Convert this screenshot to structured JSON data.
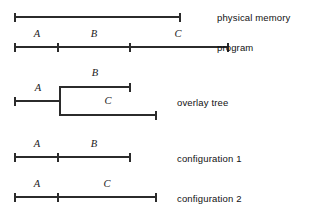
{
  "figure": {
    "stroke_color": "#2b2b2b",
    "text_color": "#111111",
    "background": "#ffffff",
    "rows": [
      {
        "id": "physical-memory",
        "label": "physical memory",
        "label_x": 217,
        "label_y": 13,
        "bar": {
          "y": 17,
          "x1": 15,
          "x2": 180
        },
        "ticks": [],
        "segments": []
      },
      {
        "id": "program",
        "label": "program",
        "label_x": 217,
        "label_y": 43,
        "bar": {
          "y": 47,
          "x1": 15,
          "x2": 228
        },
        "ticks": [
          58,
          130
        ],
        "segments": [
          {
            "text": "A",
            "x": 37,
            "y": 29
          },
          {
            "text": "B",
            "x": 94,
            "y": 29
          },
          {
            "text": "C",
            "x": 178,
            "y": 29
          }
        ]
      },
      {
        "id": "overlay-tree",
        "label": "overlay tree",
        "label_x": 177,
        "label_y": 98,
        "bar": {
          "y": 101,
          "x1": 15,
          "x2": 60
        },
        "ticks": [],
        "segments": [
          {
            "text": "A",
            "x": 38,
            "y": 83
          },
          {
            "text": "B",
            "x": 95,
            "y": 68
          },
          {
            "text": "C",
            "x": 108,
            "y": 96
          }
        ],
        "branches": [
          {
            "id": "overlay-branch-b",
            "y": 87,
            "x1": 60,
            "x2": 130
          },
          {
            "id": "overlay-branch-c",
            "y": 115,
            "x1": 60,
            "x2": 156
          }
        ],
        "connector": {
          "x": 60,
          "y1": 86,
          "y2": 116
        }
      },
      {
        "id": "configuration-1",
        "label": "configuration 1",
        "label_x": 177,
        "label_y": 154,
        "bar": {
          "y": 157,
          "x1": 15,
          "x2": 130
        },
        "ticks": [
          58
        ],
        "segments": [
          {
            "text": "A",
            "x": 37,
            "y": 139
          },
          {
            "text": "B",
            "x": 94,
            "y": 139
          }
        ]
      },
      {
        "id": "configuration-2",
        "label": "configuration 2",
        "label_x": 177,
        "label_y": 194,
        "bar": {
          "y": 197,
          "x1": 15,
          "x2": 156
        },
        "ticks": [
          58
        ],
        "segments": [
          {
            "text": "A",
            "x": 37,
            "y": 179
          },
          {
            "text": "C",
            "x": 107,
            "y": 179
          }
        ]
      }
    ]
  }
}
